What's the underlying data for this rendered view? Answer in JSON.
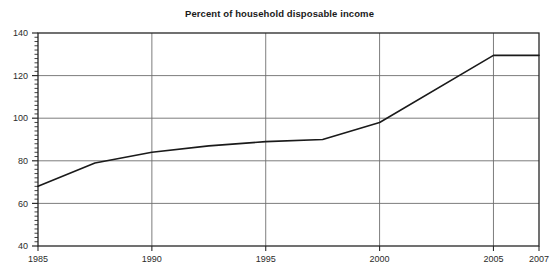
{
  "chart_data": {
    "type": "line",
    "title": "Percent of household disposable income",
    "xlabel": "",
    "ylabel": "",
    "xlim": [
      1985,
      2007
    ],
    "ylim": [
      40,
      140
    ],
    "grid": true,
    "legend": false,
    "legend_position": "none",
    "x_ticks": [
      1985,
      1990,
      1995,
      2000,
      2005,
      2007
    ],
    "x_tick_labels": [
      "1985",
      "1990",
      "1995",
      "2000",
      "2005",
      "2007"
    ],
    "y_ticks": [
      40,
      60,
      80,
      100,
      120,
      140
    ],
    "y_tick_labels": [
      "40",
      "60",
      "80",
      "100",
      "120",
      "140"
    ],
    "y_minor_tick_step": 2,
    "series": [
      {
        "name": "Household debt",
        "color": "#1a1a1a",
        "line_width": 1.6,
        "x": [
          1985,
          1987.5,
          1990,
          1992.5,
          1995,
          1997.5,
          2000,
          2005,
          2007
        ],
        "values": [
          68,
          79,
          84,
          87,
          89,
          90,
          98,
          129.5,
          129.5
        ]
      }
    ]
  },
  "style": {
    "background": "#ffffff",
    "plot_border": "#262626",
    "gridline": "#6e6e6e",
    "tick_color": "#2b2b2b",
    "line_color": "#1a1a1a"
  }
}
